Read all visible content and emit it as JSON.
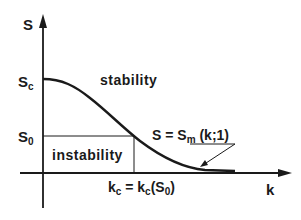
{
  "diagram": {
    "axes": {
      "y_label": "S",
      "x_label": "k"
    },
    "tick_labels": {
      "sc_main": "S",
      "sc_sub": "c",
      "s0_main": "S",
      "s0_sub": "0"
    },
    "regions": {
      "stability": "stability",
      "instability": "instability"
    },
    "curve_label": {
      "lhs": "S = S",
      "sub": "m",
      "rhs": " (k;1)"
    },
    "kc_label": {
      "k1": "k",
      "k1_sub": "c",
      "eq": " = k",
      "k2_sub": "c",
      "paren_open": "(S",
      "s_sub": "0",
      "paren_close": ")"
    }
  }
}
